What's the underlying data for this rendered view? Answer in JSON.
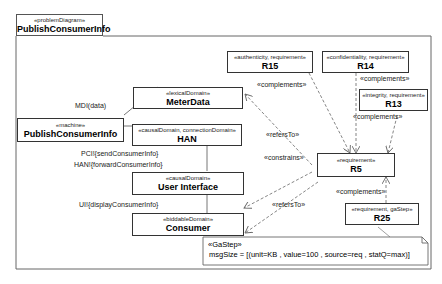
{
  "frame": {
    "stereotype": "«problemDiagram»",
    "title": "PublishConsumerInfo"
  },
  "nodes": {
    "machine": {
      "stereotype": "«machine»",
      "name": "PublishConsumerInfo"
    },
    "meterdata": {
      "stereotype": "«lexicalDomain»",
      "name": "MeterData"
    },
    "han": {
      "stereotype": "«causalDomain, connectionDomain»",
      "name": "HAN"
    },
    "ui": {
      "stereotype": "«causalDomain»",
      "name": "User Interface"
    },
    "consumer": {
      "stereotype": "«biddableDomain»",
      "name": "Consumer"
    },
    "r15": {
      "stereotype": "«authenticity, requirement»",
      "name": "R15"
    },
    "r14": {
      "stereotype": "«confidentiality, requirement»",
      "name": "R14"
    },
    "r13": {
      "stereotype": "«integrity, requirement»",
      "name": "R13"
    },
    "r5": {
      "stereotype": "«requirement»",
      "name": "R5"
    },
    "r25": {
      "stereotype": "«requirement, gaStep»",
      "name": "R25"
    }
  },
  "interfaces": {
    "mdi": "MDI(data)",
    "pci": "PCI!{sendConsumerInfo}",
    "han": "HAN!{forwardConsumerInfo}",
    "ui": "UI!{displayConsumerInfo}"
  },
  "edge_labels": {
    "complements_r15": "«complements»",
    "complements_r14": "«complements»",
    "complements_r13": "«complements»",
    "complements_r25": "«complements»",
    "refersto_meter": "«refersTo»",
    "constrains_ui": "«constrains»",
    "refersto_consumer": "«refersTo»"
  },
  "note": {
    "stereotype": "«GaStep»",
    "text": "msgSize = [(unit=KB , value=100 , source=req , statQ=max)]"
  },
  "colors": {
    "line": "#555555",
    "dashed": "#777777",
    "border": "#333333"
  }
}
